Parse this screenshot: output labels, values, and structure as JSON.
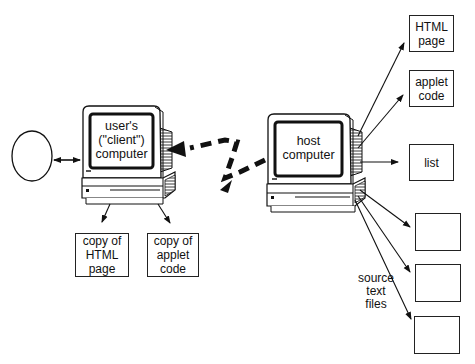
{
  "diagram": {
    "client": {
      "label_lines": [
        "user's",
        "(\"client\")",
        "computer"
      ]
    },
    "host": {
      "label_lines": [
        "host",
        "computer"
      ]
    },
    "user_node": {
      "label": ""
    },
    "client_outputs": [
      {
        "lines": [
          "copy of",
          "HTML",
          "page"
        ]
      },
      {
        "lines": [
          "copy of",
          "applet",
          "code"
        ]
      }
    ],
    "host_outputs": [
      {
        "lines": [
          "HTML",
          "page"
        ]
      },
      {
        "lines": [
          "applet",
          "code"
        ]
      },
      {
        "lines": [
          "list"
        ]
      },
      {
        "lines": [
          ""
        ]
      },
      {
        "lines": [
          ""
        ]
      },
      {
        "lines": [
          ""
        ]
      }
    ],
    "source_label_lines": [
      "source",
      "text",
      "files"
    ],
    "colors": {
      "line": "#111111",
      "background": "#ffffff",
      "screen_bezel": "#333333"
    }
  }
}
